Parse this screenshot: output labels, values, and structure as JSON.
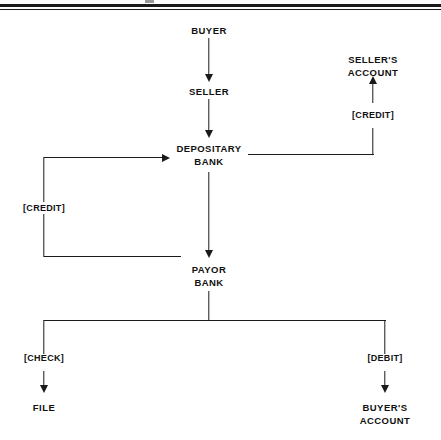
{
  "diagram": {
    "line_color": "#1a1a1a",
    "background": "#ffffff",
    "nodes": [
      {
        "id": "buyer",
        "label": "BUYER",
        "x": 209,
        "y": 30
      },
      {
        "id": "seller",
        "label": "SELLER",
        "x": 209,
        "y": 91
      },
      {
        "id": "depositary_bank",
        "label_line1": "DEPOSITARY",
        "label_line2": "BANK",
        "x": 209,
        "y": 148
      },
      {
        "id": "payor_bank",
        "label_line1": "PAYOR",
        "label_line2": "BANK",
        "x": 209,
        "y": 270
      },
      {
        "id": "sellers_account",
        "label_line1": "SELLER'S",
        "label_line2": "ACCOUNT",
        "x": 373,
        "y": 60
      },
      {
        "id": "buyers_account",
        "label_line1": "BUYER'S",
        "label_line2": "ACCOUNT",
        "x": 385,
        "y": 408
      },
      {
        "id": "file",
        "label": "FILE",
        "x": 44,
        "y": 408
      }
    ],
    "edge_labels": [
      {
        "id": "credit-sellers-account",
        "text": "[CREDIT]",
        "x": 373,
        "y": 115
      },
      {
        "id": "credit-depositary-bank",
        "text": "[CREDIT]",
        "x": 44,
        "y": 207
      },
      {
        "id": "check-file",
        "text": "[CHECK]",
        "x": 44,
        "y": 358
      },
      {
        "id": "debit-buyers-account",
        "text": "[DEBIT]",
        "x": 385,
        "y": 358
      }
    ],
    "flows": [
      {
        "from": "BUYER",
        "to": "SELLER",
        "label": ""
      },
      {
        "from": "SELLER",
        "to": "DEPOSITARY BANK",
        "label": ""
      },
      {
        "from": "DEPOSITARY BANK",
        "to": "PAYOR BANK",
        "label": ""
      },
      {
        "from": "DEPOSITARY BANK",
        "to": "SELLER'S ACCOUNT",
        "label": "[CREDIT]"
      },
      {
        "from": "PAYOR BANK",
        "to": "DEPOSITARY BANK",
        "label": "[CREDIT]"
      },
      {
        "from": "PAYOR BANK",
        "to": "FILE",
        "label": "[CHECK]"
      },
      {
        "from": "PAYOR BANK",
        "to": "BUYER'S ACCOUNT",
        "label": "[DEBIT]"
      }
    ]
  }
}
